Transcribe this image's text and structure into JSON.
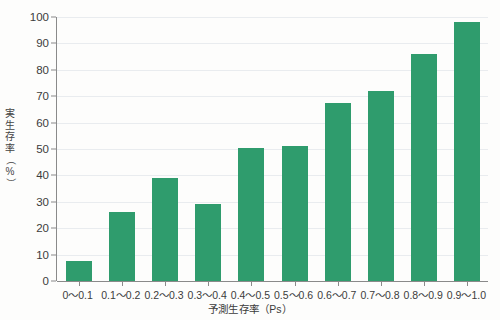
{
  "chart_data": {
    "type": "bar",
    "title": "",
    "subtitle": "",
    "xlabel": "予測生存率（Ps）",
    "ylabel": "実生存率（%）",
    "ylabel_chars": [
      "実",
      "生",
      "存",
      "率",
      "（",
      "%",
      "）"
    ],
    "categories": [
      "0〜0.1",
      "0.1〜0.2",
      "0.2〜0.3",
      "0.3〜0.4",
      "0.4〜0.5",
      "0.5〜0.6",
      "0.6〜0.7",
      "0.7〜0.8",
      "0.8〜0.9",
      "0.9〜1.0"
    ],
    "values": [
      7.5,
      26,
      39,
      29,
      50.5,
      51,
      67.5,
      72,
      86,
      98
    ],
    "ylim": [
      0,
      100
    ],
    "yticks": [
      0,
      10,
      20,
      30,
      40,
      50,
      60,
      70,
      80,
      90,
      100
    ],
    "ytick_labels": [
      "0",
      "10",
      "20",
      "30",
      "40",
      "50",
      "60",
      "70",
      "80",
      "90",
      "100"
    ],
    "grid": true,
    "grid_axis": "y",
    "legend": null,
    "legend_position": "none",
    "colors": {
      "bar": "#2f9c6d",
      "grid": "#e9ecef",
      "axis": "#8a8a8a",
      "text": "#3b3b3b",
      "background": "#fdfdfc"
    }
  }
}
